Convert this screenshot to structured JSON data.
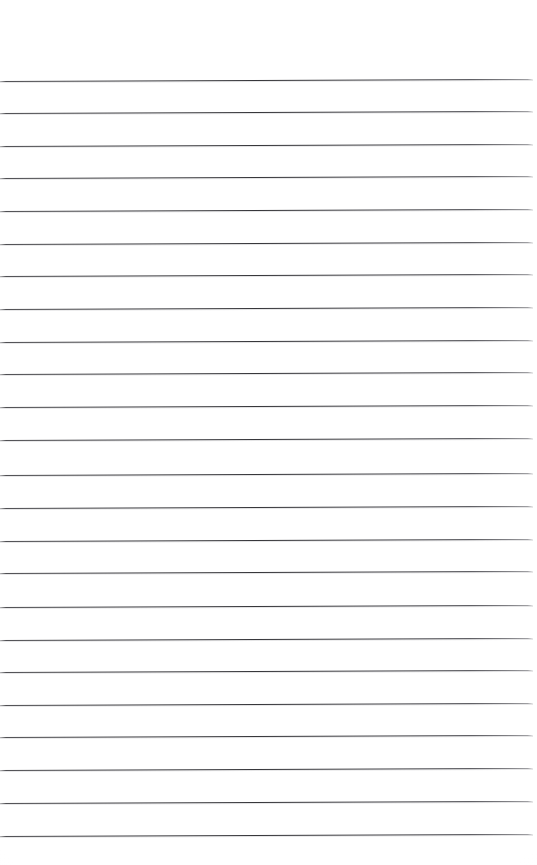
{
  "document": {
    "kind": "scanned-lined-paper",
    "title": "Blank ruled notebook page",
    "page_width_px": 537,
    "page_height_px": 865,
    "background_color": "#ffffff",
    "rule_color": "#3a3a3e",
    "rule_thickness_px": 1,
    "rule_count": 24,
    "rule_spacing_px": 32.8,
    "first_rule_y_px": 81,
    "last_rule_y_px": 836,
    "top_margin_px": 80,
    "bottom_margin_px": 27,
    "rule_left_inset_px": 0,
    "rule_right_inset_px": 5,
    "skew_degrees": -0.22,
    "has_text_content": false,
    "has_margin_rule": false,
    "has_holes": false
  },
  "rules": [
    {
      "index": 1,
      "y": 81,
      "left": 0,
      "right": 533,
      "skew": -0.22
    },
    {
      "index": 2,
      "y": 113,
      "left": 0,
      "right": 533,
      "skew": -0.22
    },
    {
      "index": 3,
      "y": 146,
      "left": 0,
      "right": 533,
      "skew": -0.22
    },
    {
      "index": 4,
      "y": 178,
      "left": 0,
      "right": 533,
      "skew": -0.22
    },
    {
      "index": 5,
      "y": 211,
      "left": 0,
      "right": 533,
      "skew": -0.22
    },
    {
      "index": 6,
      "y": 244,
      "left": 0,
      "right": 533,
      "skew": -0.22
    },
    {
      "index": 7,
      "y": 276,
      "left": 0,
      "right": 533,
      "skew": -0.22
    },
    {
      "index": 8,
      "y": 309,
      "left": 0,
      "right": 533,
      "skew": -0.22
    },
    {
      "index": 9,
      "y": 342,
      "left": 0,
      "right": 533,
      "skew": -0.22
    },
    {
      "index": 10,
      "y": 374,
      "left": 0,
      "right": 533,
      "skew": -0.22
    },
    {
      "index": 11,
      "y": 407,
      "left": 0,
      "right": 533,
      "skew": -0.22
    },
    {
      "index": 12,
      "y": 440,
      "left": 0,
      "right": 533,
      "skew": -0.22
    },
    {
      "index": 13,
      "y": 475,
      "left": 0,
      "right": 533,
      "skew": -0.22
    },
    {
      "index": 14,
      "y": 508,
      "left": 0,
      "right": 533,
      "skew": -0.22
    },
    {
      "index": 15,
      "y": 541,
      "left": 0,
      "right": 533,
      "skew": -0.22
    },
    {
      "index": 16,
      "y": 573,
      "left": 0,
      "right": 533,
      "skew": -0.22
    },
    {
      "index": 17,
      "y": 607,
      "left": 0,
      "right": 533,
      "skew": -0.22
    },
    {
      "index": 18,
      "y": 640,
      "left": 0,
      "right": 533,
      "skew": -0.22
    },
    {
      "index": 19,
      "y": 672,
      "left": 0,
      "right": 533,
      "skew": -0.22
    },
    {
      "index": 20,
      "y": 705,
      "left": 0,
      "right": 533,
      "skew": -0.22
    },
    {
      "index": 21,
      "y": 737,
      "left": 0,
      "right": 533,
      "skew": -0.22
    },
    {
      "index": 22,
      "y": 770,
      "left": 0,
      "right": 533,
      "skew": -0.22
    },
    {
      "index": 23,
      "y": 803,
      "left": 0,
      "right": 533,
      "skew": -0.22
    },
    {
      "index": 24,
      "y": 836,
      "left": 0,
      "right": 533,
      "skew": -0.22
    }
  ]
}
